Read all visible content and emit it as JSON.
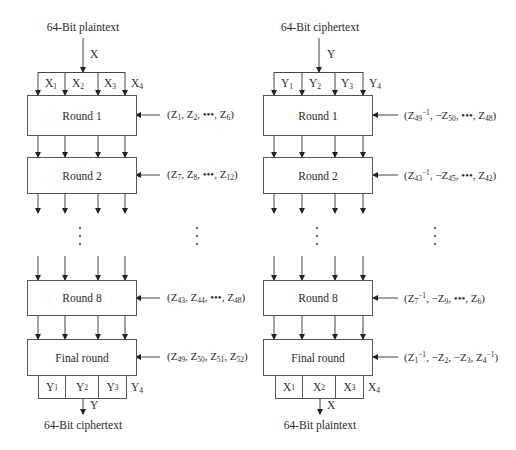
{
  "encryption": {
    "input_title": "64-Bit plaintext",
    "input_var": "X",
    "input_blocks": [
      {
        "base": "X",
        "sub": "1"
      },
      {
        "base": "X",
        "sub": "2"
      },
      {
        "base": "X",
        "sub": "3"
      },
      {
        "base": "X",
        "sub": "4"
      }
    ],
    "rounds": [
      {
        "label": "Round 1",
        "key": "(Z1, Z2, •••, Z6)"
      },
      {
        "label": "Round 2",
        "key": "(Z7, Z8, •••, Z12)"
      },
      {
        "label": "Round 8",
        "key": "(Z43, Z44, •••, Z48)"
      },
      {
        "label": "Final round",
        "key": "(Z49, Z50, Z51, Z52)"
      }
    ],
    "output_blocks": [
      {
        "base": "Y",
        "sub": "1"
      },
      {
        "base": "Y",
        "sub": "2"
      },
      {
        "base": "Y",
        "sub": "3"
      },
      {
        "base": "Y",
        "sub": "4"
      }
    ],
    "output_var": "Y",
    "output_title": "64-Bit ciphertext"
  },
  "decryption": {
    "input_title": "64-Bit ciphertext",
    "input_var": "Y",
    "input_blocks": [
      {
        "base": "Y",
        "sub": "1"
      },
      {
        "base": "Y",
        "sub": "2"
      },
      {
        "base": "Y",
        "sub": "3"
      },
      {
        "base": "Y",
        "sub": "4"
      }
    ],
    "rounds": [
      {
        "label": "Round 1",
        "key": "(Z49^-1, -Z50, •••, Z48)"
      },
      {
        "label": "Round 2",
        "key": "(Z43^-1, -Z45, •••, Z42)"
      },
      {
        "label": "Round 8",
        "key": "(Z7^-1, -Z9, •••, Z6)"
      },
      {
        "label": "Final round",
        "key": "(Z1^-1, -Z2, -Z3, Z4^-1)"
      }
    ],
    "output_blocks": [
      {
        "base": "X",
        "sub": "1"
      },
      {
        "base": "X",
        "sub": "2"
      },
      {
        "base": "X",
        "sub": "3"
      },
      {
        "base": "X",
        "sub": "4"
      }
    ],
    "output_var": "X",
    "output_title": "64-Bit plaintext"
  },
  "ellipsis": "⋮"
}
